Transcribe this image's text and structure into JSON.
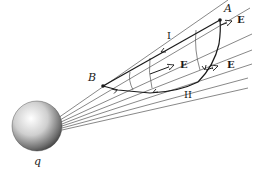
{
  "diagram": {
    "type": "electric-field-path-diagram",
    "charge": {
      "label": "q",
      "position": [
        37,
        128
      ],
      "radius": 26
    },
    "points": [
      {
        "label": "A",
        "position": [
          220,
          20
        ]
      },
      {
        "label": "B",
        "position": [
          103,
          85
        ]
      }
    ],
    "paths": [
      {
        "label": "I",
        "description": "straight path from B to A"
      },
      {
        "label": "II",
        "description": "curved path from B to A"
      }
    ],
    "field_vectors": [
      {
        "label": "E",
        "position": [
          222,
          25
        ]
      },
      {
        "label": "E",
        "position": [
          176,
          66
        ]
      },
      {
        "label": "E",
        "position": [
          210,
          67
        ]
      }
    ],
    "colors": {
      "lines": "#555555",
      "ink": "#1a1a1a"
    }
  },
  "labels": {
    "A": "A",
    "B": "B",
    "q": "q",
    "I": "I",
    "II": "II",
    "E1": "E",
    "E2": "E",
    "E3": "E"
  }
}
